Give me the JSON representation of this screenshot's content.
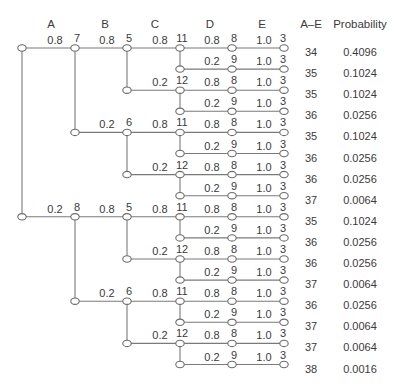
{
  "headers": {
    "stages": [
      "A",
      "B",
      "C",
      "D",
      "E"
    ],
    "total": "A–E",
    "probability": "Probability"
  },
  "tree": {
    "root": {
      "children": [
        {
          "edge_prob": "0.8",
          "node_label": "7",
          "children": [
            {
              "edge_prob": "0.8",
              "node_label": "5",
              "children": [
                {
                  "edge_prob": "0.8",
                  "node_label": "11",
                  "children": [
                    {
                      "edge_prob": "0.8",
                      "node_label": "8",
                      "children": [
                        {
                          "edge_prob": "1.0",
                          "node_label": "3"
                        }
                      ]
                    },
                    {
                      "edge_prob": "0.2",
                      "node_label": "9",
                      "children": [
                        {
                          "edge_prob": "1.0",
                          "node_label": "3"
                        }
                      ]
                    }
                  ]
                },
                {
                  "edge_prob": "0.2",
                  "node_label": "12",
                  "children": [
                    {
                      "edge_prob": "0.8",
                      "node_label": "8",
                      "children": [
                        {
                          "edge_prob": "1.0",
                          "node_label": "3"
                        }
                      ]
                    },
                    {
                      "edge_prob": "0.2",
                      "node_label": "9",
                      "children": [
                        {
                          "edge_prob": "1.0",
                          "node_label": "3"
                        }
                      ]
                    }
                  ]
                }
              ]
            },
            {
              "edge_prob": "0.2",
              "node_label": "6",
              "children": [
                {
                  "edge_prob": "0.8",
                  "node_label": "11",
                  "children": [
                    {
                      "edge_prob": "0.8",
                      "node_label": "8",
                      "children": [
                        {
                          "edge_prob": "1.0",
                          "node_label": "3"
                        }
                      ]
                    },
                    {
                      "edge_prob": "0.2",
                      "node_label": "9",
                      "children": [
                        {
                          "edge_prob": "1.0",
                          "node_label": "3"
                        }
                      ]
                    }
                  ]
                },
                {
                  "edge_prob": "0.2",
                  "node_label": "12",
                  "children": [
                    {
                      "edge_prob": "0.8",
                      "node_label": "8",
                      "children": [
                        {
                          "edge_prob": "1.0",
                          "node_label": "3"
                        }
                      ]
                    },
                    {
                      "edge_prob": "0.2",
                      "node_label": "9",
                      "children": [
                        {
                          "edge_prob": "1.0",
                          "node_label": "3"
                        }
                      ]
                    }
                  ]
                }
              ]
            }
          ]
        },
        {
          "edge_prob": "0.2",
          "node_label": "8",
          "children": [
            {
              "edge_prob": "0.8",
              "node_label": "5",
              "children": [
                {
                  "edge_prob": "0.8",
                  "node_label": "11",
                  "children": [
                    {
                      "edge_prob": "0.8",
                      "node_label": "8",
                      "children": [
                        {
                          "edge_prob": "1.0",
                          "node_label": "3"
                        }
                      ]
                    },
                    {
                      "edge_prob": "0.2",
                      "node_label": "9",
                      "children": [
                        {
                          "edge_prob": "1.0",
                          "node_label": "3"
                        }
                      ]
                    }
                  ]
                },
                {
                  "edge_prob": "0.2",
                  "node_label": "12",
                  "children": [
                    {
                      "edge_prob": "0.8",
                      "node_label": "8",
                      "children": [
                        {
                          "edge_prob": "1.0",
                          "node_label": "3"
                        }
                      ]
                    },
                    {
                      "edge_prob": "0.2",
                      "node_label": "9",
                      "children": [
                        {
                          "edge_prob": "1.0",
                          "node_label": "3"
                        }
                      ]
                    }
                  ]
                }
              ]
            },
            {
              "edge_prob": "0.2",
              "node_label": "6",
              "children": [
                {
                  "edge_prob": "0.8",
                  "node_label": "11",
                  "children": [
                    {
                      "edge_prob": "0.8",
                      "node_label": "8",
                      "children": [
                        {
                          "edge_prob": "1.0",
                          "node_label": "3"
                        }
                      ]
                    },
                    {
                      "edge_prob": "0.2",
                      "node_label": "9",
                      "children": [
                        {
                          "edge_prob": "1.0",
                          "node_label": "3"
                        }
                      ]
                    }
                  ]
                },
                {
                  "edge_prob": "0.2",
                  "node_label": "12",
                  "children": [
                    {
                      "edge_prob": "0.8",
                      "node_label": "8",
                      "children": [
                        {
                          "edge_prob": "1.0",
                          "node_label": "3"
                        }
                      ]
                    },
                    {
                      "edge_prob": "0.2",
                      "node_label": "9",
                      "children": [
                        {
                          "edge_prob": "1.0",
                          "node_label": "3"
                        }
                      ]
                    }
                  ]
                }
              ]
            }
          ]
        }
      ]
    }
  },
  "results": [
    {
      "total": "34",
      "probability": "0.4096"
    },
    {
      "total": "35",
      "probability": "0.1024"
    },
    {
      "total": "35",
      "probability": "0.1024"
    },
    {
      "total": "36",
      "probability": "0.0256"
    },
    {
      "total": "35",
      "probability": "0.1024"
    },
    {
      "total": "36",
      "probability": "0.0256"
    },
    {
      "total": "36",
      "probability": "0.0256"
    },
    {
      "total": "37",
      "probability": "0.0064"
    },
    {
      "total": "35",
      "probability": "0.1024"
    },
    {
      "total": "36",
      "probability": "0.0256"
    },
    {
      "total": "36",
      "probability": "0.0256"
    },
    {
      "total": "37",
      "probability": "0.0064"
    },
    {
      "total": "36",
      "probability": "0.0256"
    },
    {
      "total": "37",
      "probability": "0.0064"
    },
    {
      "total": "37",
      "probability": "0.0064"
    },
    {
      "total": "38",
      "probability": "0.0016"
    }
  ]
}
